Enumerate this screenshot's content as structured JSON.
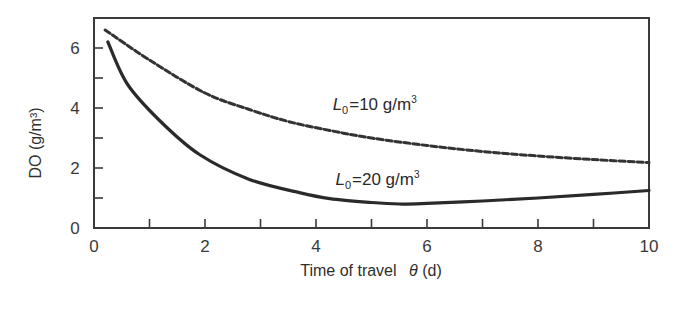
{
  "chart_data": {
    "type": "line",
    "title": "",
    "xlabel": "Time of travel",
    "xlabel_symbol": "θ",
    "xlabel_unit": "(d)",
    "ylabel": "DO (g/m³)",
    "xlim": [
      0,
      10
    ],
    "ylim": [
      0,
      7
    ],
    "xticks": [
      0,
      2,
      4,
      6,
      8,
      10
    ],
    "xticks_minor": [
      1,
      3,
      5,
      7,
      9
    ],
    "yticks": [
      0,
      2,
      4,
      6
    ],
    "yticks_minor": [
      1,
      3,
      5
    ],
    "grid": false,
    "legend": "none (inline annotations)",
    "series": [
      {
        "name": "L0=10 g/m3",
        "style": "dashed",
        "color": "#333333",
        "x": [
          0.2,
          1.0,
          2.0,
          2.8,
          3.5,
          4.25,
          5.0,
          6.0,
          7.0,
          8.0,
          9.0,
          10.0
        ],
        "y": [
          6.6,
          5.6,
          4.5,
          3.95,
          3.55,
          3.25,
          3.0,
          2.75,
          2.55,
          2.4,
          2.28,
          2.18
        ]
      },
      {
        "name": "L0=20 g/m3",
        "style": "solid",
        "color": "#2a2a2a",
        "x": [
          0.25,
          0.6,
          1.2,
          1.9,
          2.8,
          3.7,
          4.25,
          5.0,
          5.5,
          6.0,
          7.0,
          8.0,
          9.0,
          10.0
        ],
        "y": [
          6.2,
          4.8,
          3.55,
          2.45,
          1.62,
          1.18,
          0.98,
          0.85,
          0.8,
          0.82,
          0.9,
          1.0,
          1.12,
          1.25
        ]
      }
    ],
    "annotations": [
      {
        "prefix": "L",
        "sub": "0",
        "text": "=10 g/m",
        "sup": "3",
        "x": 4.3,
        "y": 3.95
      },
      {
        "prefix": "L",
        "sub": "0",
        "text": "=20 g/m",
        "sup": "3",
        "x": 4.35,
        "y": 1.45
      }
    ]
  }
}
